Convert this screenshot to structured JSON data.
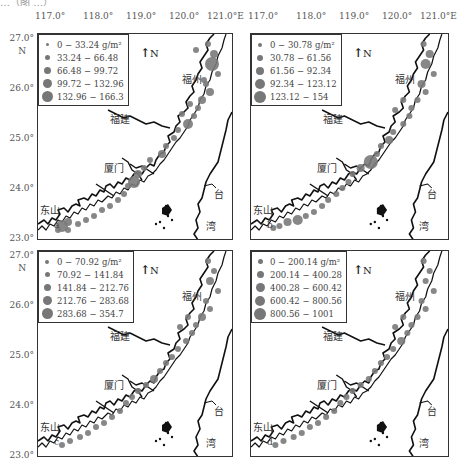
{
  "figure": {
    "top_cut_text": "…（图 …）",
    "lon_ticks": [
      "117.0°",
      "118.0°",
      "119.0°",
      "120.0°",
      "121.0°E"
    ],
    "lat_ticks": [
      "27.0°",
      "26.0°",
      "25.0°",
      "24.0°",
      "23.0°"
    ],
    "lat_unit": "N",
    "north_label": "N",
    "unit": "g/m²",
    "places": {
      "fuzhou": "福州",
      "fujian": "福建",
      "xiamen": "厦门",
      "dongshan": "东山",
      "tai": "台",
      "wan": "湾"
    },
    "colors": {
      "frame": "#333333",
      "coast": "#111111",
      "station": "#7a7a7a"
    }
  },
  "panels": [
    {
      "id": "a",
      "label": "a",
      "legend": [
        {
          "range": "0 − 33.24",
          "size": 3
        },
        {
          "range": "33.24 − 66.48",
          "size": 5
        },
        {
          "range": "66.48 − 99.72",
          "size": 7
        },
        {
          "range": "99.72 − 132.96",
          "size": 9
        },
        {
          "range": "132.96 − 166.3",
          "size": 11
        }
      ]
    },
    {
      "id": "b",
      "label": "b",
      "legend": [
        {
          "range": "0 − 30.78",
          "size": 4
        },
        {
          "range": "30.78 − 61.56",
          "size": 6
        },
        {
          "range": "61.56 − 92.34",
          "size": 8
        },
        {
          "range": "92.34 − 123.12",
          "size": 10
        },
        {
          "range": "123.12 − 154",
          "size": 12
        }
      ]
    },
    {
      "id": "c",
      "label": "c",
      "legend": [
        {
          "range": "0 − 70.92",
          "size": 4
        },
        {
          "range": "70.92 − 141.84",
          "size": 5
        },
        {
          "range": "141.84 − 212.76",
          "size": 7
        },
        {
          "range": "212.76 − 283.68",
          "size": 9
        },
        {
          "range": "283.68 − 354.7",
          "size": 11
        }
      ]
    },
    {
      "id": "d",
      "label": "d",
      "legend": [
        {
          "range": "0 − 200.14",
          "size": 5
        },
        {
          "range": "200.14 − 400.28",
          "size": 7
        },
        {
          "range": "400.28 − 600.42",
          "size": 9
        },
        {
          "range": "600.42 − 800.56",
          "size": 10
        },
        {
          "range": "800.56 − 1001",
          "size": 12
        }
      ]
    }
  ]
}
